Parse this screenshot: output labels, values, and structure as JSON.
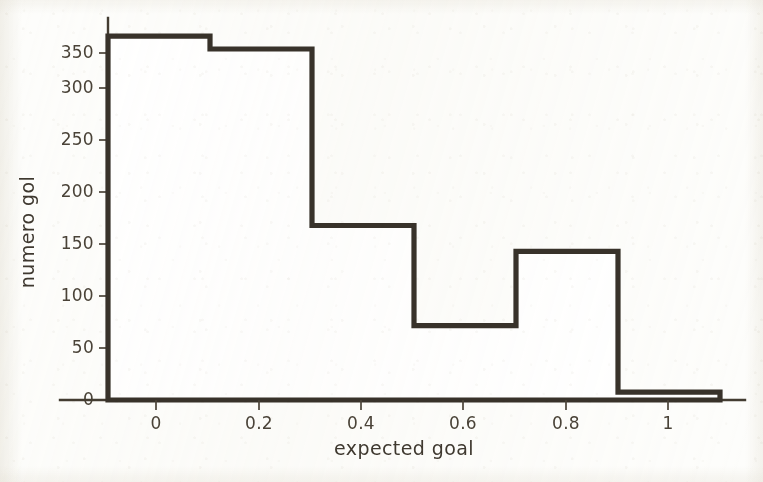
{
  "chart_data": {
    "type": "bar",
    "title": "",
    "subtitle": "",
    "xlabel": "expected goal",
    "ylabel": "numero gol",
    "grid": false,
    "legend": null,
    "xlim": [
      -0.08,
      1.18
    ],
    "ylim": [
      0,
      385
    ],
    "bin_edges": [
      -0.05,
      0.15,
      0.35,
      0.55,
      0.75,
      0.95,
      1.15
    ],
    "bin_width": 0.2,
    "categories": [
      "-0.05–0.15",
      "0.15–0.35",
      "0.35–0.55",
      "0.55–0.75",
      "0.75–0.95",
      "0.95–1.15"
    ],
    "values": [
      367,
      354,
      176,
      75,
      150,
      8
    ],
    "x_ticks": [
      0,
      0.2,
      0.4,
      0.6,
      0.8,
      1
    ],
    "x_tick_labels": [
      "0",
      "0.2",
      "0.4",
      "0.6",
      "0.8",
      "1"
    ],
    "y_ticks": [
      0,
      50,
      100,
      150,
      200,
      250,
      300,
      350
    ],
    "y_tick_labels": [
      "0",
      "50",
      "100",
      "150",
      "200",
      "250",
      "300",
      "350"
    ],
    "style": {
      "bar_fill": "#ffffff",
      "bar_stroke": "#38322a",
      "axis_color": "#433c31",
      "tick_label_color": "#4a4338",
      "axis_title_color": "#3f3930",
      "background": "#fdfdfb"
    }
  },
  "axes": {
    "x_title": "expected goal",
    "y_title": "numero gol"
  },
  "y_tick_labels": {
    "t0": "0",
    "t1": "50",
    "t2": "100",
    "t3": "150",
    "t4": "200",
    "t5": "250",
    "t6": "300",
    "t7": "350"
  },
  "x_tick_labels": {
    "t0": "0",
    "t1": "0.2",
    "t2": "0.4",
    "t3": "0.6",
    "t4": "0.8",
    "t5": "1"
  }
}
